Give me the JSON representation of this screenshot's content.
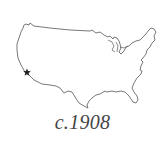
{
  "map": {
    "subject": "United States outline",
    "marker_icon": "star-icon",
    "marker_location": "Southern California",
    "stroke_color": "#555555",
    "marker_color": "#222222"
  },
  "caption": "c.1908"
}
